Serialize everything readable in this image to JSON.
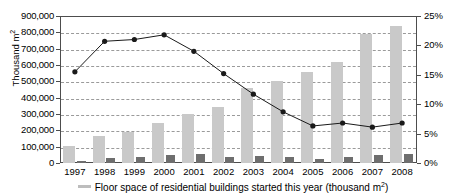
{
  "chart_data": {
    "type": "bar",
    "title": "",
    "subtitle": "",
    "xlabel": "",
    "ylabel": "Thousand m2",
    "ylabel_display": "Thousand m",
    "ylabel_sup": "2",
    "y2label": "",
    "categories": [
      "1997",
      "1998",
      "1999",
      "2000",
      "2001",
      "2002",
      "2003",
      "2004",
      "2005",
      "2006",
      "2007",
      "2008"
    ],
    "ylim": [
      0,
      900000
    ],
    "y2lim": [
      0,
      25
    ],
    "yticks": [
      0,
      100000,
      200000,
      300000,
      400000,
      500000,
      600000,
      700000,
      800000,
      900000
    ],
    "ytick_labels": [
      "0",
      "100,000",
      "200,000",
      "300,000",
      "400,000",
      "500,000",
      "600,000",
      "700,000",
      "800,000",
      "900,000"
    ],
    "y2ticks": [
      0,
      5,
      10,
      15,
      20,
      25
    ],
    "y2tick_labels": [
      "0%",
      "5%",
      "10%",
      "15%",
      "20%",
      "25%"
    ],
    "grid": true,
    "grid_style": "dashed",
    "legend_position": "bottom",
    "series": [
      {
        "name": "Floor space of residential buildings started this year (thousand m2)",
        "type": "bar",
        "axis": "left",
        "color": "#c9c9c9",
        "values": [
          105000,
          165000,
          190000,
          243000,
          300000,
          343000,
          460000,
          505000,
          560000,
          620000,
          790000,
          840000
        ]
      },
      {
        "name": "Secondary bar series",
        "type": "bar",
        "axis": "left",
        "color": "#6e6e6e",
        "values": [
          15000,
          30000,
          38000,
          50000,
          53000,
          35000,
          42000,
          35000,
          22000,
          35000,
          48000,
          55000
        ]
      },
      {
        "name": "Share (%)",
        "type": "line",
        "axis": "right",
        "color": "#1a1a1a",
        "values": [
          15.5,
          20.7,
          21.0,
          21.8,
          19.0,
          15.2,
          11.7,
          8.7,
          6.3,
          6.8,
          6.1,
          6.8
        ]
      }
    ]
  },
  "axes": {
    "left_title_main": "Thousand m",
    "left_title_sup": "2",
    "left_tick_labels": [
      "900,000",
      "800,000",
      "700,000",
      "600,000",
      "500,000",
      "400,000",
      "300,000",
      "200,000",
      "100,000",
      "0"
    ],
    "right_tick_labels": [
      "25%",
      "20%",
      "15%",
      "10%",
      "5%",
      "0%"
    ],
    "x_tick_labels": [
      "1997",
      "1998",
      "1999",
      "2000",
      "2001",
      "2002",
      "2003",
      "2004",
      "2005",
      "2006",
      "2007",
      "2008"
    ]
  },
  "legend": {
    "items": [
      {
        "swatch_color": "#bdbdbd",
        "label_main": "Floor space of residential buildings started this year (thousand m",
        "label_sup": "2",
        "label_tail": ")"
      }
    ]
  },
  "colors": {
    "bar_light": "#c9c9c9",
    "bar_dark": "#6e6e6e",
    "line": "#1a1a1a",
    "grid": "#9a9a9a",
    "axis": "#4d4d4d",
    "background": "#ffffff"
  }
}
